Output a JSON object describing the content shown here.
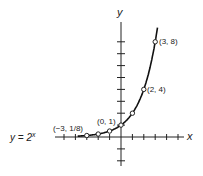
{
  "chart_data": {
    "type": "line",
    "title": "",
    "equation": "y = 2^x",
    "equation_label": "y = 2",
    "equation_exponent": "x",
    "xlabel": "x",
    "ylabel": "y",
    "xlim": [
      -4,
      5
    ],
    "ylim": [
      -3,
      9
    ],
    "grid": false,
    "points": [
      {
        "x": -3,
        "y": 0.125
      },
      {
        "x": -2,
        "y": 0.25
      },
      {
        "x": -1,
        "y": 0.5
      },
      {
        "x": 0,
        "y": 1
      },
      {
        "x": 1,
        "y": 2
      },
      {
        "x": 2,
        "y": 4
      },
      {
        "x": 3,
        "y": 8
      }
    ],
    "annotations": [
      {
        "text": "(3, 8)",
        "x": 3,
        "y": 8
      },
      {
        "text": "(2, 4)",
        "x": 2,
        "y": 4
      },
      {
        "text": "(0, 1)",
        "x": 0,
        "y": 1
      },
      {
        "text": "(−3, 1/8)",
        "x": -3,
        "y": 0.125
      }
    ]
  }
}
